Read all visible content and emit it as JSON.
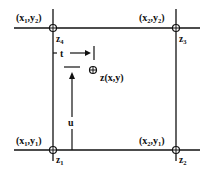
{
  "diagram": {
    "type": "bilinear-interpolation-grid-cell",
    "corners": [
      {
        "id": "bottom-left",
        "coord_label": "(x1,y1)",
        "coord_x": "x",
        "coord_x_sub": "1",
        "coord_y": "y",
        "coord_y_sub": "1",
        "z": "z",
        "z_sub": "1"
      },
      {
        "id": "bottom-right",
        "coord_label": "(x2,y1)",
        "coord_x": "x",
        "coord_x_sub": "2",
        "coord_y": "y",
        "coord_y_sub": "1",
        "z": "z",
        "z_sub": "2"
      },
      {
        "id": "top-right",
        "coord_label": "(x2,y2)",
        "coord_x": "x",
        "coord_x_sub": "2",
        "coord_y": "y",
        "coord_y_sub": "2",
        "z": "z",
        "z_sub": "3"
      },
      {
        "id": "top-left",
        "coord_label": "(x1,y2)",
        "coord_x": "x",
        "coord_x_sub": "1",
        "coord_y": "y",
        "coord_y_sub": "2",
        "z": "z",
        "z_sub": "4"
      }
    ],
    "interior_point": {
      "label": "z(x,y)"
    },
    "parameters": {
      "t": "t",
      "u": "u"
    },
    "colors": {
      "line": "#111111",
      "background": "#ffffff"
    }
  }
}
